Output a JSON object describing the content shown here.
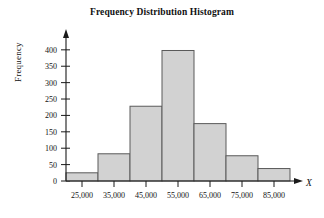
{
  "chart_data": {
    "type": "bar",
    "title": "Frequency Distribution Histogram",
    "xlabel": "X",
    "ylabel": "Frequency",
    "categories": [
      "25,000",
      "35,000",
      "45,000",
      "55,000",
      "65,000",
      "75,000",
      "85,000"
    ],
    "values": [
      25,
      83,
      228,
      398,
      175,
      77,
      38
    ],
    "ylim": [
      0,
      430
    ],
    "yticks": [
      0,
      50,
      100,
      150,
      200,
      250,
      300,
      350,
      400
    ],
    "ytick_labels": [
      "0",
      "50",
      "100",
      "150",
      "200",
      "250",
      "300",
      "350",
      "400"
    ],
    "grid": false,
    "legend": "none",
    "bar_fill": "#d2d2d2",
    "bar_stroke": "#5a5a5a",
    "axis_color": "#1a1a1a"
  }
}
